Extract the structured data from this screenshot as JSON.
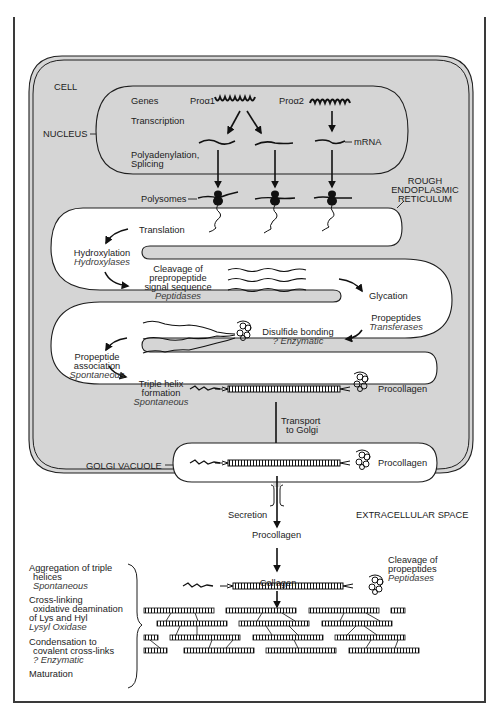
{
  "figure": {
    "regions": {
      "cell": "CELL",
      "nucleus": "NUCLEUS",
      "rough_er_line1": "ROUGH",
      "rough_er_line2": "ENDOPLASMIC",
      "rough_er_line3": "RETICULUM",
      "golgi": "GOLGI VACUOLE",
      "extracellular": "EXTRACELLULAR SPACE"
    },
    "nucleus_steps": {
      "genes": "Genes",
      "gene1": "Proα1",
      "gene2": "Proα2",
      "transcription": "Transcription",
      "polyadenylation": "Polyadenylation,",
      "splicing": "Splicing",
      "mrna": "mRNA"
    },
    "polysomes": "Polysomes",
    "er_steps": {
      "translation": "Translation",
      "hydroxylation": "Hydroxylation",
      "hydroxylases": "Hydroxylases",
      "cleavage1": "Cleavage of",
      "cleavage2": "prepropeptide",
      "cleavage3": "signal sequence",
      "peptidases": "Peptidases",
      "glycation": "Glycation",
      "propeptides": "Propeptides",
      "transferases": "Transferases",
      "disulfide": "Disulfide bonding",
      "enzymatic": "? Enzymatic",
      "propeptide_assoc1": "Propeptide",
      "propeptide_assoc2": "association",
      "spontaneous1": "Spontaneous",
      "triple1": "Triple helix",
      "triple2": "formation",
      "spontaneous2": "Spontaneous",
      "procollagen_er": "Procollagen"
    },
    "transport": {
      "line1": "Transport",
      "line2": "to Golgi"
    },
    "golgi_product": "Procollagen",
    "secretion": "Secretion",
    "extracellular_steps": {
      "procollagen": "Procollagen",
      "cleavage_prop1": "Cleavage of",
      "cleavage_prop2": "propeptides",
      "peptidases": "Peptidases",
      "collagen": "Collagen"
    },
    "maturation_list": {
      "aggregation1": "Aggregation of triple",
      "aggregation2": "helices",
      "aggregation_enzyme": "Spontaneous",
      "crosslink1": "Cross-linking",
      "crosslink2": "oxidative deamination",
      "crosslink3": "of Lys and Hyl",
      "crosslink_enzyme": "Lysyl Oxidase",
      "condensation1": "Condensation to",
      "condensation2": "covalent cross-links",
      "condensation_enzyme": "? Enzymatic",
      "maturation": "Maturation"
    },
    "colors": {
      "cell_fill": "#d5d5d5",
      "outline": "#1e1e1e",
      "frame_bar": "#4a4a4a",
      "background": "#ffffff"
    }
  }
}
